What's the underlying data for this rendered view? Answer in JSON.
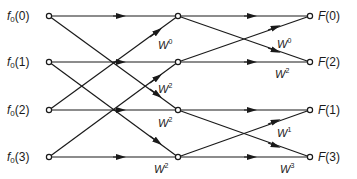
{
  "diagram": {
    "type": "fft-butterfly-flow-graph",
    "points": 4,
    "stages": 2,
    "inputs": [
      {
        "func": "f",
        "sub": "0",
        "arg": "(0)"
      },
      {
        "func": "f",
        "sub": "0",
        "arg": "(1)"
      },
      {
        "func": "f",
        "sub": "0",
        "arg": "(2)"
      },
      {
        "func": "f",
        "sub": "0",
        "arg": "(3)"
      }
    ],
    "outputs": [
      {
        "func": "F",
        "arg": "(0)"
      },
      {
        "func": "F",
        "arg": "(2)"
      },
      {
        "func": "F",
        "arg": "(1)"
      },
      {
        "func": "F",
        "arg": "(3)"
      }
    ],
    "stage1_twiddles": [
      {
        "base": "W",
        "exp": "0"
      },
      {
        "base": "W",
        "exp": "2"
      },
      {
        "base": "W",
        "exp": "2"
      },
      {
        "base": "W",
        "exp": "2"
      }
    ],
    "stage2_twiddles": [
      {
        "base": "W",
        "exp": "0"
      },
      {
        "base": "W",
        "exp": "2"
      },
      {
        "base": "W",
        "exp": "1"
      },
      {
        "base": "W",
        "exp": "3"
      }
    ],
    "colors": {
      "line": "#1a1a1a",
      "node_fill": "#ffffff",
      "background": "#ffffff"
    }
  }
}
